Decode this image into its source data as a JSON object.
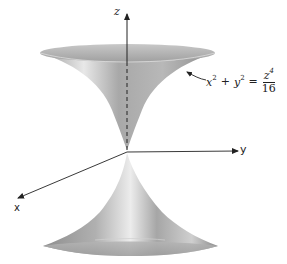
{
  "figure": {
    "axes": {
      "x_label": "x",
      "y_label": "y",
      "z_label": "z"
    },
    "equation": {
      "lhs_var1": "x",
      "lhs_exp1": "2",
      "plus": "+",
      "lhs_var2": "y",
      "lhs_exp2": "2",
      "equals": "=",
      "numerator_var": "z",
      "numerator_exp": "4",
      "denominator": "16"
    },
    "colors": {
      "surface_light": "#e6e6e6",
      "surface_mid": "#b5b5b5",
      "surface_dark": "#8a8a8a",
      "axis": "#222222"
    }
  }
}
